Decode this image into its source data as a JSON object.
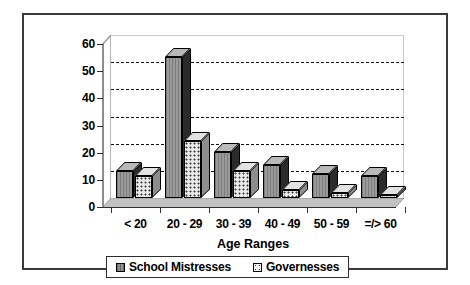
{
  "chart_data": {
    "type": "bar",
    "title": "",
    "subtitle": "",
    "xlabel": "Age Ranges",
    "ylabel": "",
    "categories": [
      "< 20",
      "20 - 29",
      "30 - 39",
      "40 - 49",
      "50 - 59",
      "=/> 60"
    ],
    "series": [
      {
        "name": "School Mistresses",
        "values": [
          10,
          52,
          17,
          12,
          9,
          8
        ]
      },
      {
        "name": "Governesses",
        "values": [
          8,
          21,
          10,
          3,
          2,
          1
        ]
      }
    ],
    "legend": [
      "School Mistresses",
      "Governesses"
    ],
    "legend_position": "bottom",
    "ylim": [
      0,
      60
    ],
    "yticks": [
      "0",
      "10",
      "20",
      "30",
      "40",
      "50",
      "60"
    ],
    "ytick_values": [
      0,
      10,
      20,
      30,
      40,
      50,
      60
    ],
    "grid": "horizontal-dashed",
    "style": "3d-clustered-column",
    "colors": {
      "series_1_fill": "#9a9a9a",
      "series_1_side": "#2b2b2b",
      "series_2_fill": "#e8e8e8",
      "series_2_side": "#8e8e8e",
      "frame_border": "#3a3a3a",
      "axis": "#2e2e2e",
      "gridline": "#111111",
      "background": "#ffffff"
    }
  },
  "ui": {
    "frame_label": "chart-frame",
    "plot_label": "plot-area"
  }
}
